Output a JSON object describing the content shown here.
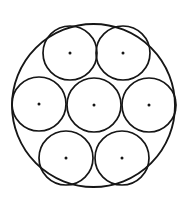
{
  "figure": {
    "canvas": {
      "width": 193,
      "height": 207,
      "background": "#ffffff"
    },
    "style": {
      "stroke_color": "#161616",
      "fill_color": "none",
      "outer_stroke_width": 1.9,
      "inner_stroke_width": 1.7,
      "center_dot_color": "#161616",
      "center_dot_radius": 1.5
    }
  },
  "chart_data": {
    "type": "diagram",
    "subtype": "circle-packing",
    "outer_circle": {
      "label": "outer-circle",
      "cx": 93.5,
      "cy": 105.5,
      "r": 81.5
    },
    "inner_radius": 27,
    "inner_circles": [
      {
        "label": "circle-center",
        "cx": 94,
        "cy": 105,
        "r": 27,
        "dot": true
      },
      {
        "label": "circle-top-left",
        "cx": 70,
        "cy": 53,
        "r": 27,
        "dot": true
      },
      {
        "label": "circle-top-right",
        "cx": 123,
        "cy": 53,
        "r": 27,
        "dot": true
      },
      {
        "label": "circle-middle-left",
        "cx": 39,
        "cy": 104,
        "r": 27,
        "dot": true
      },
      {
        "label": "circle-middle-right",
        "cx": 149,
        "cy": 105,
        "r": 27,
        "dot": true
      },
      {
        "label": "circle-bottom-left",
        "cx": 66,
        "cy": 158,
        "r": 27,
        "dot": true
      },
      {
        "label": "circle-bottom-right",
        "cx": 122,
        "cy": 158,
        "r": 27,
        "dot": true
      }
    ],
    "annotations": [],
    "legend": [],
    "grid": false
  }
}
